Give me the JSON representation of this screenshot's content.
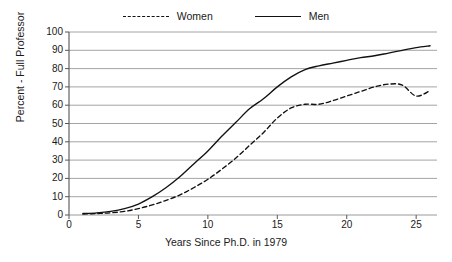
{
  "chart_data": {
    "type": "line",
    "title": "",
    "xlabel": "Years Since Ph.D. in 1979",
    "ylabel": "Percent - Full Professor",
    "xlim": [
      0,
      26.5
    ],
    "ylim": [
      0,
      100
    ],
    "xticks": [
      0,
      5,
      10,
      15,
      20,
      25
    ],
    "yticks": [
      0,
      10,
      20,
      30,
      40,
      50,
      60,
      70,
      80,
      90,
      100
    ],
    "grid": "horizontal",
    "legend_position": "top-center",
    "series": [
      {
        "name": "Women",
        "style": "dashed",
        "color": "#111111",
        "x": [
          1,
          2,
          3,
          4,
          5,
          6,
          7,
          8,
          9,
          10,
          11,
          12,
          13,
          14,
          15,
          16,
          17,
          18,
          19,
          20,
          21,
          22,
          23,
          24,
          25,
          26
        ],
        "values": [
          0.5,
          0.8,
          1.2,
          2.0,
          3.5,
          5.5,
          8.0,
          11.0,
          15.0,
          19.5,
          25.0,
          31.0,
          38.0,
          45.0,
          53.0,
          58.5,
          60.5,
          60.5,
          62.5,
          65.0,
          67.5,
          70.0,
          71.5,
          71.0,
          65.0,
          68.0
        ]
      },
      {
        "name": "Men",
        "style": "solid",
        "color": "#111111",
        "x": [
          1,
          2,
          3,
          4,
          5,
          6,
          7,
          8,
          9,
          10,
          11,
          12,
          13,
          14,
          15,
          16,
          17,
          18,
          19,
          20,
          21,
          22,
          23,
          24,
          25,
          26
        ],
        "values": [
          0.8,
          1.2,
          2.0,
          3.5,
          6.0,
          10.0,
          15.0,
          21.0,
          28.0,
          35.0,
          43.0,
          50.5,
          58.0,
          63.5,
          70.0,
          75.5,
          79.5,
          81.5,
          83.0,
          84.5,
          86.0,
          87.0,
          88.5,
          90.0,
          91.5,
          92.5
        ]
      }
    ]
  },
  "legend": {
    "items": [
      {
        "label": "Women",
        "style": "dashed"
      },
      {
        "label": "Men",
        "style": "solid"
      }
    ]
  },
  "axes": {
    "x_title": "Years Since Ph.D. in 1979",
    "y_title": "Percent - Full Professor",
    "x_tick_labels": [
      "0",
      "5",
      "10",
      "15",
      "20",
      "25"
    ],
    "y_tick_labels": [
      "0",
      "10",
      "20",
      "30",
      "40",
      "50",
      "60",
      "70",
      "80",
      "90",
      "100"
    ]
  },
  "colors": {
    "line": "#111111",
    "grid": "#9a9a9a",
    "axis": "#555555",
    "background": "#ffffff",
    "text": "#1a1a1a"
  }
}
